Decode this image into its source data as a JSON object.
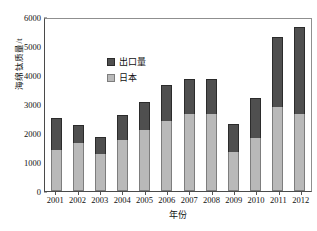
{
  "chart_data": {
    "type": "bar",
    "subtype": "stacked-bar",
    "title": "",
    "xlabel": "年份",
    "ylabel": "海绵钛质量/t",
    "ylim": [
      0,
      6000
    ],
    "yticks": [
      0,
      1000,
      2000,
      3000,
      4000,
      5000,
      6000
    ],
    "grid": false,
    "legend_position": "upper-left-inside",
    "categories": [
      "2001",
      "2002",
      "2003",
      "2004",
      "2005",
      "2006",
      "2007",
      "2008",
      "2009",
      "2010",
      "2011",
      "2012"
    ],
    "series": [
      {
        "name": "日本",
        "color": "#b9b9b9",
        "values": [
          1420,
          1670,
          1260,
          1750,
          2100,
          2400,
          2670,
          2670,
          1360,
          1840,
          2880,
          2640
        ]
      },
      {
        "name": "出口量",
        "color": "#4f4f4f",
        "values": [
          1100,
          590,
          590,
          860,
          960,
          1270,
          1210,
          1210,
          960,
          1360,
          2430,
          3010
        ]
      }
    ],
    "totals": [
      2520,
      2260,
      1850,
      2610,
      3060,
      3670,
      3880,
      3880,
      2320,
      3200,
      5310,
      5650
    ]
  },
  "legend": {
    "items": [
      {
        "label": "出口量"
      },
      {
        "label": "日本"
      }
    ]
  },
  "colors": {
    "export": "#4f4f4f",
    "japan": "#b9b9b9",
    "axis": "#4a4a4a",
    "background": "#ffffff"
  }
}
